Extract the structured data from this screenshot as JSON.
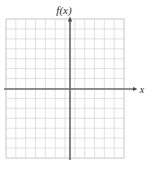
{
  "figure": {
    "name": "blank-coordinate-grid",
    "background_color": "#ffffff"
  },
  "chart_data": {
    "type": "scatter",
    "title": "",
    "subtitle": "",
    "xlabel": "x",
    "ylabel": "f(x)",
    "series": [],
    "x": [],
    "values": [],
    "annotations": [],
    "legend": null,
    "legend_position": "none",
    "grid": true,
    "grid_color": "#d8d8d8",
    "grid_minor_step": 1,
    "axis_color": "#6b6b6b",
    "xlim": [
      -6.4,
      5.4
    ],
    "ylim": [
      -6.9,
      7.0
    ],
    "xticks": [
      -6,
      -5,
      -4,
      -3,
      -2,
      -1,
      0,
      1,
      2,
      3,
      4,
      5
    ],
    "yticks": [
      -6,
      -5,
      -4,
      -3,
      -2,
      -1,
      0,
      1,
      2,
      3,
      4,
      5,
      6,
      7
    ],
    "xtick_labels": [],
    "ytick_labels": [],
    "grid_columns": 12,
    "grid_rows": 14,
    "origin_cell_x": 6,
    "origin_cell_y": 7,
    "x_axis_arrow": "right",
    "y_axis_arrow": "up"
  },
  "labels": {
    "y_axis": "f(x)",
    "x_axis": "x"
  },
  "colors": {
    "grid": "#d9d9d9",
    "grid_light": "#e6e6e6",
    "axis": "#6e6e6e",
    "text": "#2b2b2b",
    "background": "#ffffff"
  }
}
